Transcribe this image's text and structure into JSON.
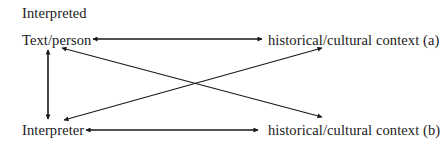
{
  "diagram": {
    "heading": "Interpreted",
    "nodes": {
      "text_person": "Text/person",
      "context_a": "historical/cultural context (a)",
      "interpreter": "Interpreter",
      "context_b": "historical/cultural context (b)"
    },
    "edges": [
      {
        "from": "Text/person",
        "to": "historical/cultural context (a)",
        "direction": "bidirectional"
      },
      {
        "from": "Text/person",
        "to": "Interpreter",
        "direction": "bidirectional"
      },
      {
        "from": "Interpreter",
        "to": "historical/cultural context (b)",
        "direction": "bidirectional"
      },
      {
        "from": "Text/person",
        "to": "historical/cultural context (b)",
        "direction": "bidirectional"
      },
      {
        "from": "Interpreter",
        "to": "historical/cultural context (a)",
        "direction": "to-context-a"
      }
    ],
    "colors": {
      "text": "#1a1a1a",
      "lines": "#1a1a1a",
      "background": "#ffffff"
    }
  }
}
